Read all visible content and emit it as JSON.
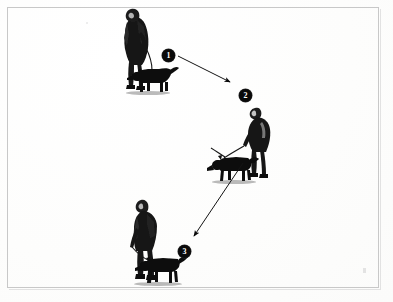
{
  "figure": {
    "background_color": "#fefefe",
    "ink_color": "#0a0a0a",
    "frame_color": "#c8c8c8"
  },
  "markers": [
    {
      "id": "marker-1",
      "label": "1",
      "x": 162,
      "y": 49
    },
    {
      "id": "marker-2",
      "label": "2",
      "x": 239,
      "y": 89
    },
    {
      "id": "marker-3",
      "label": "3",
      "x": 178,
      "y": 245
    }
  ],
  "stages": [
    {
      "id": "stage-1",
      "marker": "1",
      "caption": "Handler walking with dog on lead",
      "x": 108,
      "y": 6
    },
    {
      "id": "stage-2",
      "marker": "2",
      "caption": "Handler bending as dog casts and searches ground scent",
      "x": 214,
      "y": 105
    },
    {
      "id": "stage-3",
      "marker": "3",
      "caption": "Handler standing with dog working ahead on lead",
      "x": 118,
      "y": 196
    }
  ],
  "arrows": [
    {
      "id": "arrow-1-to-2",
      "from_marker": "1",
      "to_marker": "2",
      "x1": 178,
      "y1": 56,
      "x2": 232,
      "y2": 83,
      "direction": "down-right"
    },
    {
      "id": "arrow-2-to-3",
      "from_marker": "2",
      "to_marker": "3",
      "x1": 243,
      "y1": 163,
      "x2": 192,
      "y2": 238,
      "direction": "down-left"
    }
  ]
}
